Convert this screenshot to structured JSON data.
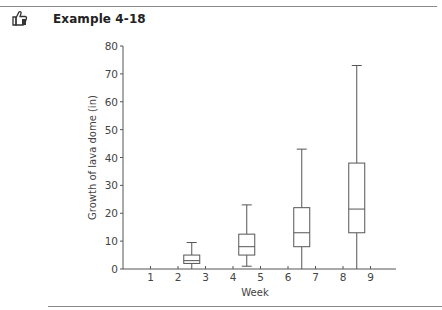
{
  "header": {
    "icon": "thumbs-up-icon",
    "title": "Example 4-18"
  },
  "chart_data": {
    "type": "boxplot",
    "title": "",
    "xlabel": "Week",
    "ylabel": "Growth of lava dome (in)",
    "ylim": [
      0,
      80
    ],
    "xlim": [
      0,
      10
    ],
    "y_ticks": [
      0,
      10,
      20,
      30,
      40,
      50,
      60,
      70,
      80
    ],
    "x_ticks": [
      1,
      2,
      3,
      4,
      5,
      6,
      7,
      8,
      9
    ],
    "grid": false,
    "legend": null,
    "series": [
      {
        "name": "Box 1",
        "x_center": 2.5,
        "min": 0,
        "q1": 2,
        "median": 3,
        "q3": 5,
        "max": 9.5
      },
      {
        "name": "Box 2",
        "x_center": 4.5,
        "min": 1,
        "q1": 5,
        "median": 8,
        "q3": 12.5,
        "max": 23
      },
      {
        "name": "Box 3",
        "x_center": 6.5,
        "min": 0,
        "q1": 8,
        "median": 13,
        "q3": 22,
        "max": 43
      },
      {
        "name": "Box 4",
        "x_center": 8.5,
        "min": 0,
        "q1": 13,
        "median": 21.5,
        "q3": 38,
        "max": 73
      }
    ]
  },
  "colors": {
    "axis": "#555555",
    "box_stroke": "#555555",
    "rule": "#8a8a8a"
  }
}
